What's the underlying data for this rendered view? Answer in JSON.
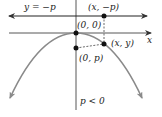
{
  "figure": {
    "directrix_label": "y = −p",
    "x_axis_label": "x",
    "points": {
      "directrix_point": "(x, −p)",
      "vertex": "(0, 0)",
      "curve_point": "(x, y)",
      "focus": "(0, p)"
    },
    "condition": "p < 0"
  },
  "colors": {
    "axis": "#333333",
    "parabola": "#8a8a8a",
    "point": "#111111"
  }
}
